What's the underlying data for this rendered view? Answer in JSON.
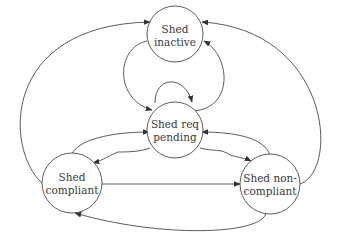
{
  "diagram": {
    "type": "state-transition",
    "colors": {
      "stroke": "#4a4a4a",
      "text": "#3a3a3a",
      "background": "#ffffff"
    },
    "nodes": [
      {
        "id": "inactive",
        "line1": "Shed",
        "line2": "inactive"
      },
      {
        "id": "pending",
        "line1": "Shed req",
        "line2": "pending"
      },
      {
        "id": "compliant",
        "line1": "Shed",
        "line2": "compliant"
      },
      {
        "id": "noncompliant",
        "line1": "Shed non-",
        "line2": "compliant"
      }
    ],
    "edges": [
      {
        "from": "compliant",
        "to": "inactive"
      },
      {
        "from": "noncompliant",
        "to": "inactive"
      },
      {
        "from": "inactive",
        "to": "pending"
      },
      {
        "from": "pending",
        "to": "inactive"
      },
      {
        "from": "pending",
        "to": "pending"
      },
      {
        "from": "compliant",
        "to": "pending"
      },
      {
        "from": "noncompliant",
        "to": "pending"
      },
      {
        "from": "pending",
        "to": "compliant"
      },
      {
        "from": "pending",
        "to": "noncompliant"
      },
      {
        "from": "compliant",
        "to": "noncompliant"
      },
      {
        "from": "noncompliant",
        "to": "compliant"
      }
    ]
  }
}
